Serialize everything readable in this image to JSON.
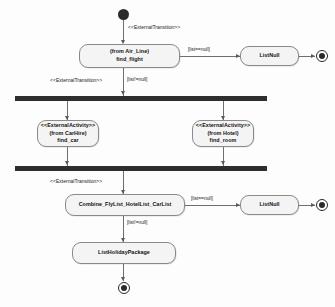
{
  "diagram": {
    "type": "uml-activity-diagram",
    "background_color": "#fdfdfd",
    "node_fill_color": "#f4f4f4",
    "node_border_color": "#8a8a8a",
    "bar_color": "#2e2e2e",
    "line_color": "#6f6f6f"
  },
  "nodes": {
    "initial_start": {
      "kind": "initial-state",
      "label": ""
    },
    "find_flight": {
      "kind": "activity",
      "lines": [
        "(from Air_Line)",
        "find_flight"
      ],
      "line1": "(from Air_Line)",
      "line2": "find_flight"
    },
    "list_null_top": {
      "kind": "activity",
      "label": "ListNull"
    },
    "final_top": {
      "kind": "final-state",
      "label": ""
    },
    "fork_bar": {
      "kind": "fork-bar",
      "label": ""
    },
    "find_car": {
      "kind": "activity",
      "lines": [
        "<<ExternalActivity>>",
        "(from CarHire)",
        "find_car"
      ],
      "line1": "<<ExternalActivity>>",
      "line2": "(from CarHire)",
      "line3": "find_car"
    },
    "find_room": {
      "kind": "activity",
      "lines": [
        "<<ExternalActivity>>",
        "(from Hotel)",
        "find_room"
      ],
      "line1": "<<ExternalActivity>>",
      "line2": "(from Hotel)",
      "line3": "find_room"
    },
    "join_bar": {
      "kind": "join-bar",
      "label": ""
    },
    "combine": {
      "kind": "activity",
      "label": "Combine_FlyList_HotelList_CarList"
    },
    "list_null_bottom": {
      "kind": "activity",
      "label": "ListNull"
    },
    "final_bottom_right": {
      "kind": "final-state",
      "label": ""
    },
    "list_holiday_package": {
      "kind": "activity",
      "label": "ListHolidayPackage"
    },
    "final_end": {
      "kind": "final-state",
      "label": ""
    }
  },
  "edges": {
    "start_to_find_flight": {
      "stereotype": "<<ExternalTransition>>"
    },
    "find_flight_to_listnull": {
      "guard": "[list==null]"
    },
    "find_flight_to_fork_stereotype": {
      "stereotype": "<<ExternalTransition>>"
    },
    "find_flight_to_fork_guard": {
      "guard": "[list!=null]"
    },
    "join_to_combine": {
      "stereotype": "<<ExternalTransition>>"
    },
    "combine_to_listnull": {
      "guard": "[list==null]"
    },
    "combine_to_package": {
      "guard": "[list!=null]"
    }
  }
}
